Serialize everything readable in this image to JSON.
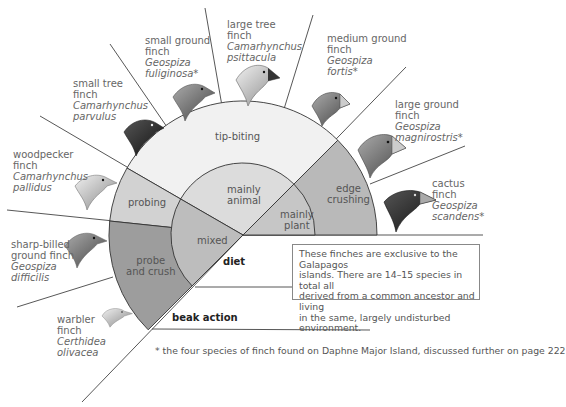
{
  "diagram": {
    "title": "",
    "center": {
      "x": 243,
      "y": 235
    },
    "outer_radius": 134,
    "inner_radius": 72,
    "colors": {
      "tip_biting": "#f1f1f1",
      "probing": "#d2d2d2",
      "probe_and_crush": "#9d9d9d",
      "edge_crushing": "#b9b9b9",
      "mainly_animal": "#dcdcdc",
      "mixed": "#bdbdbd",
      "mainly_plant": "#c6c6c6",
      "line": "#333333"
    },
    "rings": {
      "beak_action": {
        "label": "beak action",
        "segments": [
          {
            "label": "edge crushing",
            "start_deg": 0,
            "end_deg": 45
          },
          {
            "label": "tip-biting",
            "start_deg": 45,
            "end_deg": 150
          },
          {
            "label": "probing",
            "start_deg": 150,
            "end_deg": 174
          },
          {
            "label_line1": "probe",
            "label_line2": "and crush",
            "start_deg": 174,
            "end_deg": 225
          }
        ]
      },
      "diet": {
        "label": "diet",
        "segments": [
          {
            "label_line1": "mainly",
            "label_line2": "plant",
            "start_deg": 0,
            "end_deg": 45
          },
          {
            "label_line1": "mainly",
            "label_line2": "animal",
            "start_deg": 45,
            "end_deg": 150
          },
          {
            "label": "mixed",
            "start_deg": 150,
            "end_deg": 225
          }
        ]
      }
    },
    "species": [
      {
        "common_line1": "warbler",
        "common_line2": "finch",
        "sci_line1": "Certhidea",
        "sci_line2": "olivacea",
        "asterisk": false
      },
      {
        "common_line1": "sharp-billed",
        "common_line2": "ground finch",
        "sci_line1": "Geospiza",
        "sci_line2": "difficilis",
        "asterisk": false
      },
      {
        "common_line1": "woodpecker",
        "common_line2": "finch",
        "sci_line1": "Camarhynchus",
        "sci_line2": "pallidus",
        "asterisk": false
      },
      {
        "common_line1": "small tree",
        "common_line2": "finch",
        "sci_line1": "Camarhynchus",
        "sci_line2": "parvulus",
        "asterisk": false
      },
      {
        "common_line1": "small ground",
        "common_line2": "finch",
        "sci_line1": "Geospiza",
        "sci_line2": "fuliginosa*",
        "asterisk": true
      },
      {
        "common_line1": "large tree",
        "common_line2": "finch",
        "sci_line1": "Camarhynchus",
        "sci_line2": "psittacula",
        "asterisk": false
      },
      {
        "common_line1": "medium ground",
        "common_line2": "finch",
        "sci_line1": "Geospiza",
        "sci_line2": "fortis*",
        "asterisk": true
      },
      {
        "common_line1": "large ground",
        "common_line2": "finch",
        "sci_line1": "Geospiza",
        "sci_line2": "magnirostris*",
        "asterisk": true
      },
      {
        "common_line1": "cactus",
        "common_line2": "finch",
        "sci_line1": "Geospiza",
        "sci_line2": "scandens*",
        "asterisk": true
      }
    ],
    "info_box": {
      "line1": "These finches are exclusive to the Galapagos",
      "line2": "islands. There are 14–15 species in total all",
      "line3": "derived from a common ancestor and living",
      "line4": "in the same, largely undisturbed environment."
    },
    "footnote": "* the four species of finch found on Daphne Major Island, discussed further on page 222"
  }
}
